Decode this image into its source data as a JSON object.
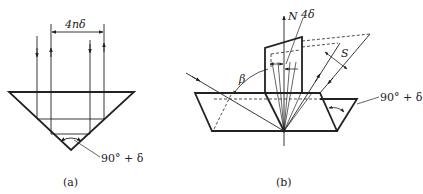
{
  "figure": {
    "panel_a": {
      "caption": "(a)",
      "dimension_label": "4nδ",
      "angle_label": "90° + δ",
      "description": "Inverted right-angle prism (apex angle 90°+δ) with two incoming and two returning vertical rays; returning beams are separated by 4nδ"
    },
    "panel_b": {
      "caption": "(b)",
      "normal_label": "N",
      "deviation_label": "4δ",
      "angle_beta_label": "β",
      "separation_label": "S",
      "angle_label": "90° + δ",
      "description": "Tilted prism arrangement showing incident ray at angle β, a fan of reflected rays about normal N diverging by 4δ, and beam separation S"
    }
  },
  "colors": {
    "line": "#222222",
    "background": "#ffffff"
  }
}
